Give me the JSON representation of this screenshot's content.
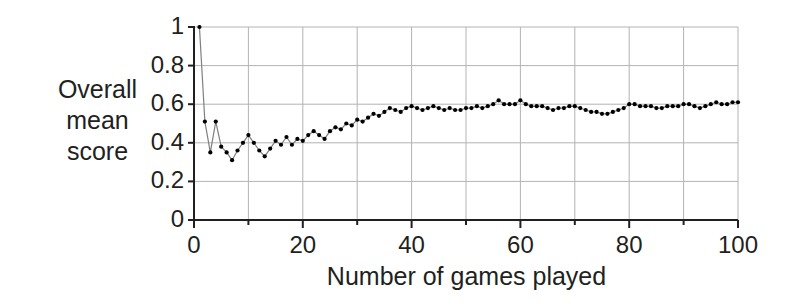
{
  "chart_data": {
    "type": "line",
    "title": "",
    "xlabel": "Number of games played",
    "ylabel": "Overall mean score",
    "ylabel_lines": [
      "Overall",
      "mean",
      "score"
    ],
    "xlim": [
      0,
      100
    ],
    "ylim": [
      0,
      1
    ],
    "xticks": [
      0,
      20,
      40,
      60,
      80,
      100
    ],
    "xtick_labels": [
      "0",
      "20",
      "40",
      "60",
      "80",
      "100"
    ],
    "xminor_step": 10,
    "yticks": [
      0,
      0.2,
      0.4,
      0.6,
      0.8,
      1
    ],
    "ytick_labels": [
      "0",
      "0.2",
      "0.4",
      "0.6",
      "0.8",
      "1"
    ],
    "grid": true,
    "grid_color": "#b3b3b3",
    "legend": null,
    "marker": "circle",
    "marker_color": "#000000",
    "line_color": "#7f7f7f",
    "series": [
      {
        "name": "Overall mean score",
        "x": [
          1,
          2,
          3,
          4,
          5,
          6,
          7,
          8,
          9,
          10,
          11,
          12,
          13,
          14,
          15,
          16,
          17,
          18,
          19,
          20,
          21,
          22,
          23,
          24,
          25,
          26,
          27,
          28,
          29,
          30,
          31,
          32,
          33,
          34,
          35,
          36,
          37,
          38,
          39,
          40,
          41,
          42,
          43,
          44,
          45,
          46,
          47,
          48,
          49,
          50,
          51,
          52,
          53,
          54,
          55,
          56,
          57,
          58,
          59,
          60,
          61,
          62,
          63,
          64,
          65,
          66,
          67,
          68,
          69,
          70,
          71,
          72,
          73,
          74,
          75,
          76,
          77,
          78,
          79,
          80,
          81,
          82,
          83,
          84,
          85,
          86,
          87,
          88,
          89,
          90,
          91,
          92,
          93,
          94,
          95,
          96,
          97,
          98,
          99,
          100
        ],
        "values": [
          1.0,
          0.51,
          0.35,
          0.51,
          0.38,
          0.35,
          0.31,
          0.36,
          0.4,
          0.44,
          0.4,
          0.36,
          0.33,
          0.37,
          0.41,
          0.39,
          0.43,
          0.39,
          0.42,
          0.41,
          0.44,
          0.46,
          0.44,
          0.42,
          0.46,
          0.48,
          0.47,
          0.5,
          0.49,
          0.52,
          0.51,
          0.53,
          0.55,
          0.54,
          0.56,
          0.58,
          0.57,
          0.56,
          0.58,
          0.59,
          0.58,
          0.57,
          0.58,
          0.59,
          0.58,
          0.57,
          0.58,
          0.57,
          0.57,
          0.58,
          0.58,
          0.59,
          0.58,
          0.59,
          0.6,
          0.62,
          0.6,
          0.6,
          0.6,
          0.62,
          0.6,
          0.59,
          0.59,
          0.59,
          0.58,
          0.57,
          0.58,
          0.58,
          0.59,
          0.59,
          0.58,
          0.57,
          0.56,
          0.56,
          0.55,
          0.55,
          0.56,
          0.57,
          0.58,
          0.6,
          0.6,
          0.59,
          0.59,
          0.59,
          0.58,
          0.58,
          0.59,
          0.59,
          0.59,
          0.6,
          0.6,
          0.59,
          0.58,
          0.59,
          0.6,
          0.61,
          0.6,
          0.6,
          0.61,
          0.61
        ]
      }
    ]
  }
}
